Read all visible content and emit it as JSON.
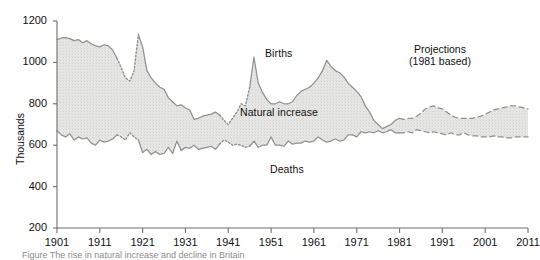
{
  "figure": {
    "ylabel": "Thousands",
    "caption": "Figure    The rise in natural increase and decline in Britain"
  },
  "annotations": {
    "births": "Births",
    "deaths": "Deaths",
    "natural_increase": "Natural increase",
    "projections_line1": "Projections",
    "projections_line2": "(1981 based)"
  },
  "colors": {
    "line": "#8f9191",
    "fill": "#e3e3e1",
    "axis": "#6f6f6f",
    "text": "#111111"
  },
  "chart_data": {
    "type": "area",
    "title": "",
    "xlabel": "",
    "ylabel": "Thousands",
    "xlim": [
      1901,
      2011
    ],
    "ylim": [
      200,
      1200
    ],
    "xticks": [
      1901,
      1911,
      1921,
      1931,
      1941,
      1951,
      1961,
      1971,
      1981,
      1991,
      2001,
      2011
    ],
    "yticks": [
      200,
      400,
      600,
      800,
      1000,
      1200
    ],
    "grid": false,
    "legend": "inline-annotations",
    "series": [
      {
        "name": "Births",
        "style": "solid-with-dotted-war-gaps-and-dashed-projection",
        "x": [
          1901,
          1902,
          1903,
          1904,
          1905,
          1906,
          1907,
          1908,
          1909,
          1910,
          1911,
          1912,
          1913,
          1914,
          1915,
          1916,
          1917,
          1918,
          1919,
          1920,
          1921,
          1922,
          1923,
          1924,
          1925,
          1926,
          1927,
          1928,
          1929,
          1930,
          1931,
          1932,
          1933,
          1934,
          1935,
          1936,
          1937,
          1938,
          1939,
          1940,
          1941,
          1942,
          1943,
          1944,
          1945,
          1946,
          1947,
          1948,
          1949,
          1950,
          1951,
          1952,
          1953,
          1954,
          1955,
          1956,
          1957,
          1958,
          1959,
          1960,
          1961,
          1962,
          1963,
          1964,
          1965,
          1966,
          1967,
          1968,
          1969,
          1970,
          1971,
          1972,
          1973,
          1974,
          1975,
          1976,
          1977,
          1978,
          1979,
          1980,
          1981,
          1982,
          1983,
          1984,
          1985,
          1986,
          1987,
          1988,
          1989,
          1990,
          1991,
          1992,
          1993,
          1994,
          1995,
          1996,
          1997,
          1998,
          1999,
          2000,
          2001,
          2002,
          2003,
          2004,
          2005,
          2006,
          2007,
          2008,
          2009,
          2010,
          2011
        ],
        "values": [
          1110,
          1118,
          1120,
          1115,
          1105,
          1110,
          1095,
          1105,
          1090,
          1080,
          1075,
          1085,
          1080,
          1060,
          1020,
          975,
          925,
          910,
          960,
          1135,
          1075,
          960,
          925,
          900,
          880,
          870,
          830,
          810,
          790,
          795,
          780,
          770,
          725,
          730,
          740,
          745,
          750,
          760,
          745,
          720,
          700,
          730,
          760,
          800,
          790,
          880,
          1025,
          900,
          855,
          820,
          800,
          800,
          810,
          800,
          800,
          810,
          840,
          860,
          870,
          880,
          900,
          925,
          960,
          1010,
          980,
          960,
          950,
          930,
          900,
          880,
          860,
          835,
          790,
          760,
          720,
          700,
          680,
          690,
          700,
          720,
          730,
          725,
          730,
          730,
          740,
          755,
          775,
          785,
          790,
          780,
          775,
          760,
          745,
          735,
          730,
          730,
          730,
          730,
          735,
          740,
          750,
          760,
          770,
          775,
          780,
          785,
          790,
          790,
          785,
          780,
          775
        ]
      },
      {
        "name": "Deaths",
        "style": "solid-with-dotted-war-gaps-and-dashed-projection",
        "x": [
          1901,
          1902,
          1903,
          1904,
          1905,
          1906,
          1907,
          1908,
          1909,
          1910,
          1911,
          1912,
          1913,
          1914,
          1915,
          1916,
          1917,
          1918,
          1919,
          1920,
          1921,
          1922,
          1923,
          1924,
          1925,
          1926,
          1927,
          1928,
          1929,
          1930,
          1931,
          1932,
          1933,
          1934,
          1935,
          1936,
          1937,
          1938,
          1939,
          1940,
          1941,
          1942,
          1943,
          1944,
          1945,
          1946,
          1947,
          1948,
          1949,
          1950,
          1951,
          1952,
          1953,
          1954,
          1955,
          1956,
          1957,
          1958,
          1959,
          1960,
          1961,
          1962,
          1963,
          1964,
          1965,
          1966,
          1967,
          1968,
          1969,
          1970,
          1971,
          1972,
          1973,
          1974,
          1975,
          1976,
          1977,
          1978,
          1979,
          1980,
          1981,
          1982,
          1983,
          1984,
          1985,
          1986,
          1987,
          1988,
          1989,
          1990,
          1991,
          1992,
          1993,
          1994,
          1995,
          1996,
          1997,
          1998,
          1999,
          2000,
          2001,
          2002,
          2003,
          2004,
          2005,
          2006,
          2007,
          2008,
          2009,
          2010,
          2011
        ],
        "values": [
          670,
          650,
          640,
          655,
          625,
          640,
          630,
          635,
          610,
          600,
          625,
          615,
          620,
          630,
          650,
          640,
          625,
          660,
          640,
          625,
          565,
          580,
          555,
          570,
          555,
          560,
          590,
          560,
          620,
          575,
          590,
          585,
          600,
          580,
          585,
          590,
          595,
          580,
          605,
          625,
          615,
          600,
          605,
          600,
          590,
          595,
          620,
          590,
          600,
          600,
          640,
          600,
          600,
          595,
          620,
          605,
          610,
          610,
          620,
          615,
          620,
          640,
          625,
          615,
          620,
          630,
          620,
          625,
          650,
          650,
          640,
          665,
          660,
          665,
          660,
          670,
          660,
          665,
          675,
          660,
          660,
          660,
          665,
          660,
          675,
          670,
          665,
          660,
          665,
          660,
          655,
          650,
          660,
          650,
          650,
          660,
          650,
          645,
          645,
          640,
          640,
          640,
          645,
          640,
          640,
          635,
          635,
          640,
          640,
          640,
          640
        ]
      }
    ]
  }
}
